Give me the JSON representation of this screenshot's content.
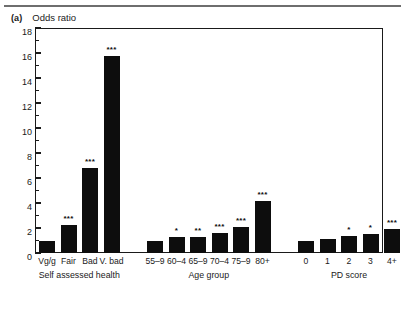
{
  "figure": {
    "panel_letter": "(a)",
    "axis_title": "Odds ratio",
    "top_rule": true
  },
  "chart_data": {
    "type": "bar",
    "title": "Odds ratio",
    "xlabel": "",
    "ylabel": "Odds ratio",
    "ylim": [
      0,
      18
    ],
    "ytick_step": 2,
    "yticks": [
      0,
      2,
      4,
      6,
      8,
      10,
      12,
      14,
      16,
      18
    ],
    "ytick_labels": [
      "0",
      "2",
      "4",
      "6",
      "8",
      "10",
      "12",
      "14",
      "16",
      "18"
    ],
    "minor_ticks": true,
    "grid": false,
    "legend": null,
    "bar_color": "#0d0d0d",
    "groups": [
      {
        "name": "Self assessed health",
        "categories": [
          "Vg/g",
          "Fair",
          "Bad",
          "V. bad"
        ],
        "values": [
          1.0,
          2.25,
          6.8,
          15.8
        ],
        "significance": [
          "",
          "***",
          "***",
          "***"
        ]
      },
      {
        "name": "Age group",
        "categories": [
          "55–9",
          "60–4",
          "65–9",
          "70–4",
          "75–9",
          "80+"
        ],
        "values": [
          1.0,
          1.25,
          1.3,
          1.6,
          2.1,
          4.2
        ],
        "significance": [
          "",
          "*",
          "**",
          "***",
          "***",
          "***"
        ]
      },
      {
        "name": "PD score",
        "categories": [
          "0",
          "1",
          "2",
          "3",
          "4+"
        ],
        "values": [
          1.0,
          1.15,
          1.35,
          1.5,
          1.95
        ],
        "significance": [
          "",
          "",
          "*",
          "*",
          "***"
        ]
      }
    ]
  }
}
